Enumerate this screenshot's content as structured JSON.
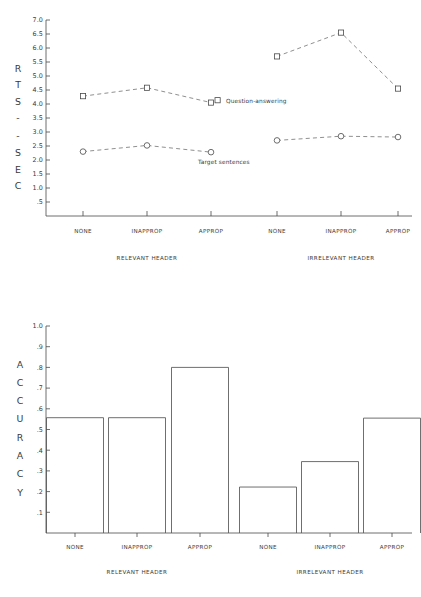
{
  "figure": {
    "background": "#ffffff",
    "ink_color": "#3a3a3a"
  },
  "chart_data": [
    {
      "id": "reaction-times",
      "type": "line",
      "title": "",
      "ylabel": "RTS--SEC",
      "ylabel_letters": [
        "R",
        "T",
        "S",
        "-",
        "-",
        "S",
        "E",
        "C"
      ],
      "xlabel": "",
      "ylim": [
        0.0,
        7.0
      ],
      "yticks": [
        0.5,
        1.0,
        1.5,
        2.0,
        2.5,
        3.0,
        3.5,
        4.0,
        4.5,
        5.0,
        5.5,
        6.0,
        6.5,
        7.0
      ],
      "ytick_labels": [
        ".5",
        "1.0",
        "1.5",
        "2.0",
        "2.5",
        "3.0",
        "3.5",
        "4.0",
        "4.5",
        "5.0",
        "5.5",
        "6.0",
        "6.5",
        "7.0"
      ],
      "grid": false,
      "legend_position": "inline-right-of-series",
      "categories": [
        "NONE",
        "INAPPROP",
        "APPROP",
        "NONE",
        "INAPPROP",
        "APPROP"
      ],
      "groups": [
        {
          "label": "RELEVANT HEADER",
          "categories": [
            "NONE",
            "INAPPROP",
            "APPROP"
          ]
        },
        {
          "label": "IRRELEVANT HEADER",
          "categories": [
            "NONE",
            "INAPPROP",
            "APPROP"
          ]
        }
      ],
      "series": [
        {
          "name": "Question-answering",
          "marker": "square",
          "linestyle": "dashed",
          "values": [
            4.28,
            4.58,
            4.05,
            5.7,
            6.55,
            4.55
          ],
          "segments": [
            [
              4.28,
              4.58,
              4.05
            ],
            [
              5.7,
              6.55,
              4.55
            ]
          ],
          "label_text": "Question-answering"
        },
        {
          "name": "Target sentences",
          "marker": "circle",
          "linestyle": "dashed",
          "values": [
            2.3,
            2.52,
            2.28,
            2.7,
            2.85,
            2.82
          ],
          "segments": [
            [
              2.3,
              2.52,
              2.28
            ],
            [
              2.7,
              2.85,
              2.82
            ]
          ],
          "label_text": "Target sentences"
        }
      ]
    },
    {
      "id": "accuracy",
      "type": "bar",
      "title": "",
      "ylabel": "ACCURACY",
      "ylabel_letters": [
        "A",
        "C",
        "C",
        "U",
        "R",
        "A",
        "C",
        "Y"
      ],
      "xlabel": "",
      "ylim": [
        0.0,
        1.0
      ],
      "yticks": [
        0.1,
        0.2,
        0.3,
        0.4,
        0.5,
        0.6,
        0.7,
        0.8,
        0.9,
        1.0
      ],
      "ytick_labels": [
        ".1",
        ".2",
        ".3",
        ".4",
        ".5",
        ".6",
        ".7",
        ".8",
        ".9",
        "1.0"
      ],
      "grid": false,
      "categories": [
        "NONE",
        "INAPPROP",
        "APPROP",
        "NONE",
        "INAPPROP",
        "APPROP"
      ],
      "values": [
        0.557,
        0.557,
        0.8,
        0.222,
        0.345,
        0.555
      ],
      "groups": [
        {
          "label": "RELEVANT HEADER",
          "categories": [
            "NONE",
            "INAPPROP",
            "APPROP"
          ]
        },
        {
          "label": "IRRELEVANT HEADER",
          "categories": [
            "NONE",
            "INAPPROP",
            "APPROP"
          ]
        }
      ]
    }
  ],
  "panel_rt": {
    "yaxis_letters": [
      "R",
      "T",
      "S",
      "-",
      "-",
      "S",
      "E",
      "C"
    ],
    "ytick_labels": [
      "7.0",
      "6.5",
      "6.0",
      "5.5",
      "5.0",
      "4.5",
      "4.0",
      "3.5",
      "3.0",
      "2.5",
      "2.0",
      "1.5",
      "1.0",
      ".5"
    ],
    "cat_labels": [
      "NONE",
      "INAPPROP",
      "APPROP",
      "NONE",
      "INAPPROP",
      "APPROP"
    ],
    "group_labels": [
      "RELEVANT HEADER",
      "IRRELEVANT HEADER"
    ],
    "series_labels": [
      "Question-answering",
      "Target sentences"
    ]
  },
  "panel_acc": {
    "yaxis_letters": [
      "A",
      "C",
      "C",
      "U",
      "R",
      "A",
      "C",
      "Y"
    ],
    "ytick_labels": [
      "1.0",
      ".9",
      ".8",
      ".7",
      ".6",
      ".5",
      ".4",
      ".3",
      ".2",
      ".1"
    ],
    "cat_labels": [
      "NONE",
      "INAPPROP",
      "APPROP",
      "NONE",
      "INAPPROP",
      "APPROP"
    ],
    "group_labels": [
      "RELEVANT HEADER",
      "IRRELEVANT HEADER"
    ]
  }
}
